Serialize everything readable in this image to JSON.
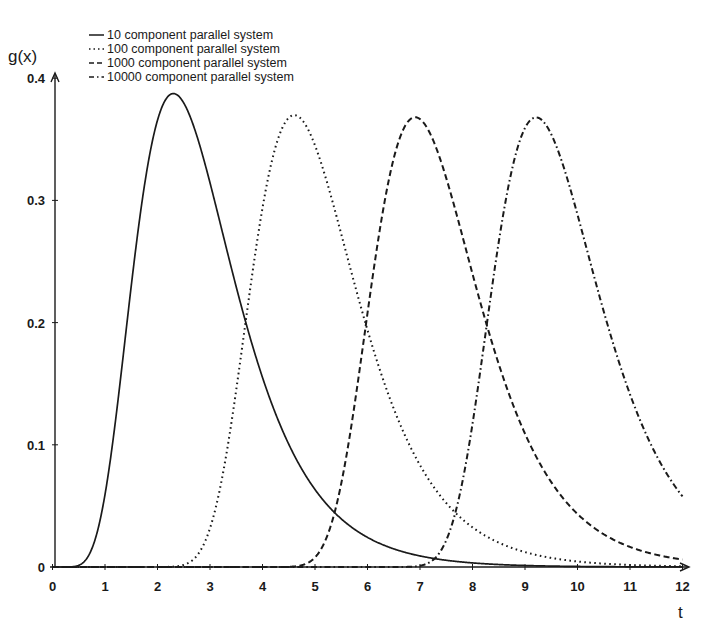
{
  "chart_data": {
    "type": "line",
    "title": "",
    "xlabel": "t",
    "ylabel": "g(x)",
    "xlim": [
      0,
      12
    ],
    "ylim": [
      0,
      0.4
    ],
    "x_ticks": [
      "0",
      "1",
      "2",
      "3",
      "4",
      "5",
      "6",
      "7",
      "8",
      "9",
      "10",
      "11",
      "12"
    ],
    "y_ticks": [
      "0",
      "0.1",
      "0.2",
      "0.3",
      "0.4"
    ],
    "grid": false,
    "legend_position": "top-left",
    "x": [
      0,
      1,
      2,
      2.3,
      3,
      4,
      4.6,
      5,
      6,
      6.9,
      7,
      8,
      9,
      9.2,
      10,
      11,
      12
    ],
    "series": [
      {
        "name": "10 component parallel system",
        "n": 10,
        "style": "solid",
        "values": [
          0,
          0.0584,
          0.3628,
          0.3874,
          0.3148,
          0.1333,
          0.078,
          0.0571,
          0.0218,
          0.0093,
          0.0083,
          0.003,
          0.0011,
          0.0009,
          0.0004,
          0.0002,
          0.0001
        ]
      },
      {
        "name": "100 component parallel system",
        "n": 100,
        "style": "dotted",
        "values": [
          0,
          0,
          0,
          0,
          0.0033,
          0.1605,
          0.3666,
          0.3406,
          0.2162,
          0.1015,
          0.0903,
          0.032,
          0.0117,
          0.0096,
          0.0043,
          0.0016,
          0.0006
        ]
      },
      {
        "name": "1000 component parallel system",
        "n": 1000,
        "style": "dashed",
        "values": [
          0,
          0,
          0,
          0,
          0,
          0,
          0,
          0.0005,
          0.1309,
          0.3679,
          0.3628,
          0.2174,
          0.1108,
          0.0926,
          0.0434,
          0.0165,
          0.0061
        ]
      },
      {
        "name": "10000 component parallel system",
        "n": 10000,
        "style": "dash-dot",
        "values": [
          0,
          0,
          0,
          0,
          0,
          0,
          0,
          0,
          0,
          0,
          0,
          0.0013,
          0.3282,
          0.3679,
          0.2999,
          0.1422,
          0.0577
        ]
      }
    ]
  },
  "legend": {
    "items": [
      {
        "label": "10 component parallel system",
        "style": "solid"
      },
      {
        "label": "100 component parallel system",
        "style": "dotted"
      },
      {
        "label": "1000 component parallel system",
        "style": "dashed"
      },
      {
        "label": "10000 component parallel system",
        "style": "dash-dot"
      }
    ]
  },
  "axes": {
    "x_title": "t",
    "y_title": "g(x)"
  },
  "colors": {
    "ink": "#1a1a1a",
    "background": "#ffffff"
  }
}
